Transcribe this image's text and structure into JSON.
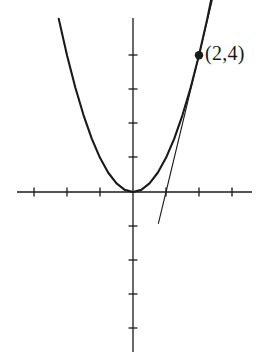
{
  "figure": {
    "background_color": "#ffffff",
    "stroke_color": "#1a1a1a",
    "annotations": [
      {
        "name": "point-label",
        "text": "(2,4)",
        "x": 2,
        "y": 4
      }
    ]
  },
  "chart_data": {
    "type": "line",
    "title": "",
    "subtitle": "",
    "xlabel": "",
    "ylabel": "",
    "xlim": [
      -4.0,
      3.9
    ],
    "ylim": [
      -4.9,
      5.3
    ],
    "grid": false,
    "legend": null,
    "axes": {
      "x_axis_at_y": 0,
      "y_axis_at_x": 0,
      "x_ticks": [
        -3,
        -2,
        -1,
        1,
        2,
        3
      ],
      "y_ticks": [
        -4,
        -3,
        -2,
        -1,
        1,
        2,
        3,
        4
      ],
      "tick_labels_shown": false,
      "tick_length_px": 9,
      "origin_px": [
        133,
        192
      ],
      "unit_px_x": 33,
      "unit_px_y": 34.2
    },
    "series": [
      {
        "name": "parabola",
        "equation": "y = x^2",
        "type": "curve",
        "line_width": 2.1,
        "x": [
          -2.25,
          -2.0,
          -1.75,
          -1.5,
          -1.25,
          -1.0,
          -0.75,
          -0.5,
          -0.25,
          0,
          0.25,
          0.5,
          0.75,
          1.0,
          1.25,
          1.5,
          1.75,
          2.0,
          2.25,
          2.45
        ],
        "values": [
          5.0625,
          4.0,
          3.0625,
          2.25,
          1.5625,
          1.0,
          0.5625,
          0.25,
          0.0625,
          0,
          0.0625,
          0.25,
          0.5625,
          1.0,
          1.5625,
          2.25,
          3.0625,
          4.0,
          5.0625,
          6.0025
        ]
      },
      {
        "name": "tangent-line",
        "equation": "y = 4x - 4",
        "type": "line",
        "line_width": 1.1,
        "x": [
          0.77,
          1.0,
          2.0,
          2.4
        ],
        "values": [
          -0.92,
          0.0,
          4.0,
          5.6
        ]
      }
    ],
    "points": [
      {
        "name": "tangency-point",
        "x": 2,
        "y": 4,
        "label": "(2,4)",
        "marker": "filled-circle",
        "marker_radius_px": 4.2
      }
    ]
  }
}
